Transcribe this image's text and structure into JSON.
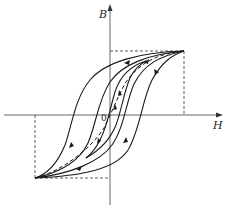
{
  "figure": {
    "axes": {
      "x_label": "H",
      "y_label": "B",
      "origin_label": "0"
    },
    "colors": {
      "stroke": "#1a1a1a",
      "dashed": "#333333",
      "background": "#ffffff"
    },
    "elements": {
      "loops": [
        {
          "name": "outer-loop",
          "description": "largest saturated hysteresis loop"
        },
        {
          "name": "middle-loop",
          "description": "intermediate hysteresis loop"
        },
        {
          "name": "inner-loop",
          "description": "smallest minor hysteresis loop"
        }
      ],
      "initial_magnetization_curve": "dashed curve through origin to saturation tips",
      "saturation_guides": "dashed rectangles from tips to axes"
    }
  }
}
